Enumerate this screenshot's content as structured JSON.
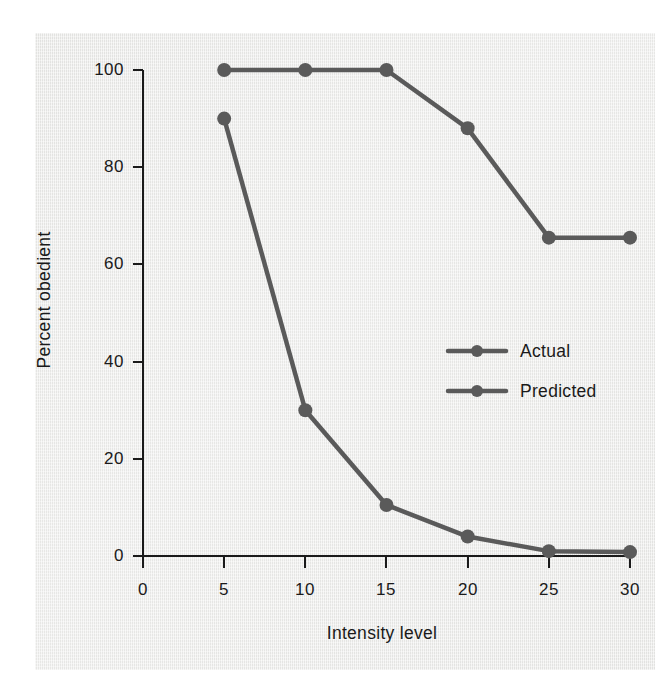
{
  "figure": {
    "background_color": "#eeeeec",
    "page_color": "#ffffff",
    "ink_color": "#5a5a5a",
    "axis_color": "#1a1a1a"
  },
  "chart_data": {
    "type": "line",
    "title": "",
    "subtitle": "",
    "xlabel": "Intensity level",
    "ylabel": "Percent obedient",
    "xlim": [
      0,
      30
    ],
    "ylim": [
      0,
      100
    ],
    "xticks": [
      "0",
      "5",
      "10",
      "15",
      "20",
      "25",
      "30"
    ],
    "yticks": [
      "0",
      "20",
      "40",
      "60",
      "80",
      "100"
    ],
    "x": [
      5,
      10,
      15,
      20,
      25,
      30
    ],
    "grid": false,
    "legend_position": "center-right",
    "series": [
      {
        "name": "Actual",
        "color": "#5a5a5a",
        "marker": "circle",
        "values": [
          90,
          30,
          10.5,
          4,
          1,
          0.8
        ]
      },
      {
        "name": "Predicted",
        "color": "#5a5a5a",
        "marker": "circle",
        "values": [
          100,
          100,
          100,
          88,
          65.5,
          65.5
        ]
      }
    ]
  },
  "legend": {
    "items": [
      {
        "label": "Actual"
      },
      {
        "label": "Predicted"
      }
    ]
  }
}
